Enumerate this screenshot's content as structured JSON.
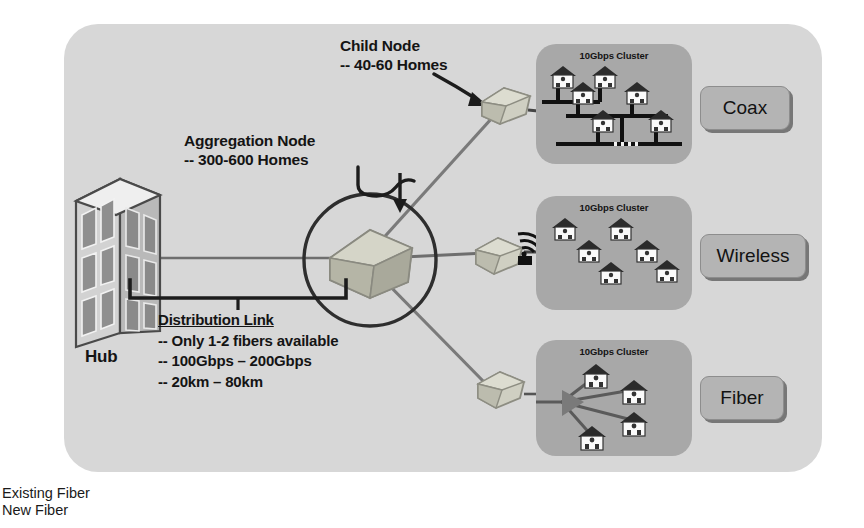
{
  "diagram": {
    "panel_color": "#d7d7d7",
    "cluster_color": "#a8a8a8",
    "button_color": "#b4b4b4"
  },
  "hub": {
    "label": "Hub",
    "icon": "building-icon"
  },
  "annotations": {
    "child_node": {
      "line1": "Child Node",
      "line2": "-- 40-60 Homes"
    },
    "aggregation_node": {
      "line1": "Aggregation Node",
      "line2": "-- 300-600 Homes"
    },
    "distribution_link": {
      "heading": "Distribution Link",
      "line1": "-- Only 1-2 fibers available",
      "line2": "-- 100Gbps – 200Gbps",
      "line3": "-- 20km – 80km"
    }
  },
  "clusters": [
    {
      "id": "coax",
      "title": "10Gbps Cluster",
      "topology": "bus-tree",
      "house_count": 6,
      "button_label": "Coax"
    },
    {
      "id": "wireless",
      "title": "10Gbps Cluster",
      "topology": "wireless",
      "house_count": 6,
      "button_label": "Wireless"
    },
    {
      "id": "fiber",
      "title": "10Gbps Cluster",
      "topology": "star",
      "house_count": 4,
      "button_label": "Fiber"
    }
  ],
  "legend": {
    "existing_fiber": "Existing Fiber",
    "new_fiber": "New Fiber"
  }
}
